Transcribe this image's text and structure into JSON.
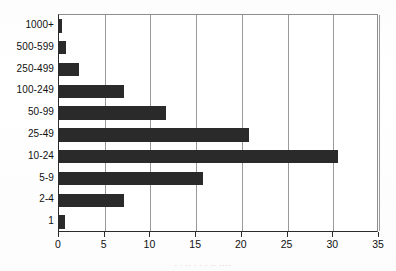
{
  "chart_data": {
    "type": "bar",
    "orientation": "horizontal",
    "title": "",
    "xlabel": "",
    "ylabel": "",
    "xlim": [
      0,
      35
    ],
    "xticks": [
      0,
      5,
      10,
      15,
      20,
      25,
      30,
      35
    ],
    "xtick_labels": [
      "0",
      "5",
      "10",
      "15",
      "20",
      "25",
      "30",
      "35"
    ],
    "grid": "vertical",
    "legend": "none",
    "bar_color": "#2a2a2a",
    "categories": [
      "1000+",
      "500-599",
      "250-499",
      "100-249",
      "50-99",
      "25-49",
      "10-24",
      "5-9",
      "2-4",
      "1"
    ],
    "values": [
      0.3,
      0.8,
      2.2,
      7.1,
      11.7,
      20.8,
      30.5,
      15.8,
      7.1,
      0.7
    ]
  },
  "caption": {
    "remnant": "·  ·   ··   ·   ·   ·    ··    ····"
  }
}
